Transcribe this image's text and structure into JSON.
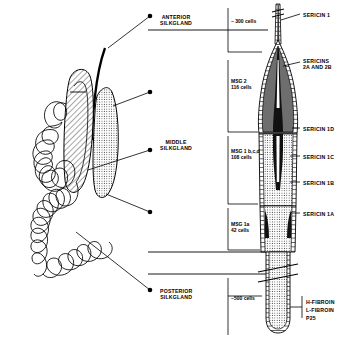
{
  "figure": {
    "type": "anatomical-diagram"
  },
  "region_labels": [
    {
      "id": "anterior",
      "text": "ANTERIOR\nSILKGLAND",
      "x": 160,
      "y": 14
    },
    {
      "id": "middle",
      "text": "MIDDLE\nSILKGLAND",
      "x": 160,
      "y": 139
    },
    {
      "id": "posterior",
      "text": "POSTERIOR\nSILKGLAND",
      "x": 160,
      "y": 288
    }
  ],
  "cell_counts": [
    {
      "id": "anterior-cells",
      "text": "~ 300 cells",
      "x": 231,
      "y": 18
    },
    {
      "id": "msg2",
      "text": "MSG 2\n116 cells",
      "x": 231,
      "y": 78
    },
    {
      "id": "msg1bcd",
      "text": "MSG 1 b,c,d\n108 cells",
      "x": 231,
      "y": 148
    },
    {
      "id": "msg1a",
      "text": "MSG 1a\n42 cells",
      "x": 231,
      "y": 221
    },
    {
      "id": "posterior-cells",
      "text": "~500 cells",
      "x": 231,
      "y": 295
    }
  ],
  "protein_labels": [
    {
      "id": "sericin-1",
      "text": "SERICIN 1",
      "x": 303,
      "y": 12
    },
    {
      "id": "sericins-2ab",
      "text": "SERICINS\n2A and 2B",
      "x": 303,
      "y": 58
    },
    {
      "id": "sericin-1d",
      "text": "SERICIN 1D",
      "x": 303,
      "y": 126
    },
    {
      "id": "sericin-1c",
      "text": "SERICIN 1C",
      "x": 303,
      "y": 154
    },
    {
      "id": "sericin-1b",
      "text": "SERICIN 1B",
      "x": 303,
      "y": 180
    },
    {
      "id": "sericin-1a",
      "text": "SERICIN 1A",
      "x": 303,
      "y": 211
    }
  ],
  "fibroin_labels": [
    {
      "id": "h-fibroin",
      "text": "H-FIBROIN",
      "x": 306,
      "y": 299
    },
    {
      "id": "l-fibroin",
      "text": "L-FIBROIN",
      "x": 306,
      "y": 307
    },
    {
      "id": "p25",
      "text": "P25",
      "x": 306,
      "y": 315
    }
  ],
  "colors": {
    "stroke": "#000000",
    "background": "#ffffff",
    "lumen_dark": "#6e6e6e",
    "lumen_mid": "#9a9a9a",
    "lumen_light": "#c9c9c9",
    "stipple": "#b5b5b5"
  }
}
